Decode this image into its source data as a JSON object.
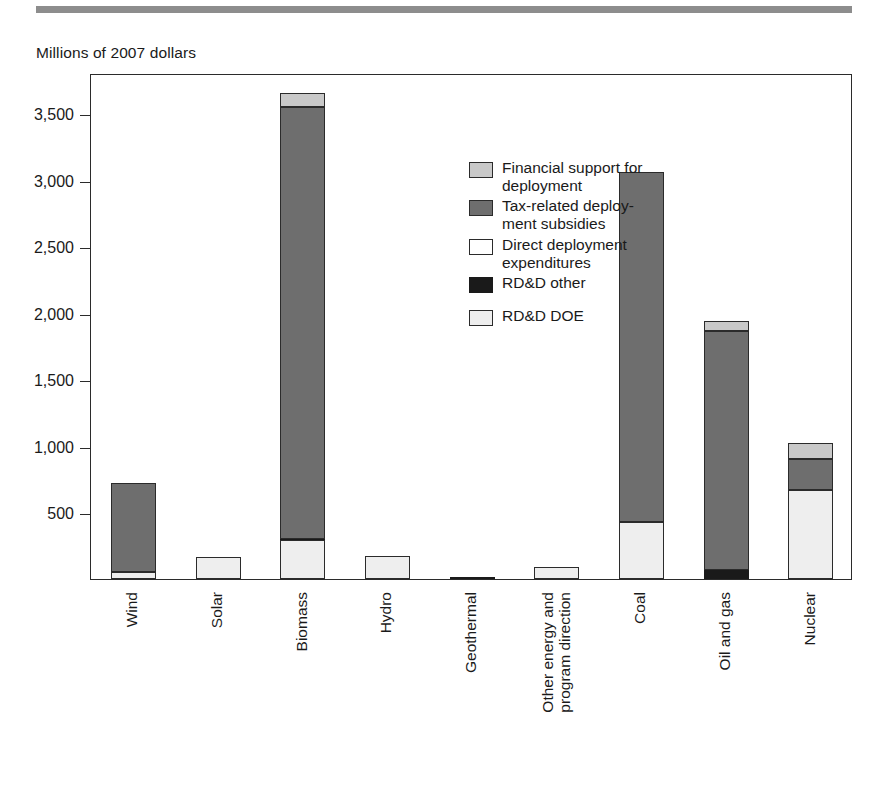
{
  "figure": {
    "axis_title": "Millions of 2007 dollars",
    "rule_color": "#8d8d8d"
  },
  "legend": {
    "position": "inside-top-center",
    "entries": [
      {
        "key": "financial",
        "label": "Financial support for\ndeployment",
        "color": "#c9c9c9",
        "swatch": "light-gray-square-icon"
      },
      {
        "key": "tax",
        "label": "Tax-related deploy-\nment subsidies",
        "color": "#6e6e6e",
        "swatch": "dark-gray-square-icon"
      },
      {
        "key": "direct",
        "label": "Direct deployment\nexpenditures",
        "color": "#ffffff",
        "swatch": "white-square-icon"
      },
      {
        "key": "rdd_other",
        "label": "RD&D other",
        "color": "#1a1a1a",
        "swatch": "black-square-icon"
      },
      {
        "key": "rdd_doe",
        "label": "RD&D DOE",
        "color": "#eeeeee",
        "swatch": "very-light-gray-square-icon"
      }
    ]
  },
  "chart_data": {
    "type": "bar",
    "stacked": true,
    "title": "",
    "subtitle": "",
    "xlabel": "",
    "ylabel": "Millions of 2007 dollars",
    "ylim": [
      0,
      3800
    ],
    "yticks": [
      500,
      1000,
      1500,
      2000,
      2500,
      3000,
      3500
    ],
    "ytick_labels": [
      "500",
      "1,000",
      "1,500",
      "2,000",
      "2,500",
      "3,000",
      "3,500"
    ],
    "grid": false,
    "legend_position": "inside-top-center",
    "categories": [
      "Wind",
      "Solar",
      "Biomass",
      "Hydro",
      "Geothermal",
      "Other energy and\nprogram direction",
      "Coal",
      "Oil and gas",
      "Nuclear"
    ],
    "series": [
      {
        "name": "RD&D DOE",
        "key": "rdd_doe",
        "color": "#eeeeee",
        "values": [
          50,
          165,
          290,
          175,
          0,
          90,
          430,
          0,
          670
        ]
      },
      {
        "name": "RD&D other",
        "key": "rdd_other",
        "color": "#1a1a1a",
        "values": [
          0,
          0,
          12,
          0,
          15,
          0,
          0,
          65,
          0
        ]
      },
      {
        "name": "Direct deployment expenditures",
        "key": "direct",
        "color": "#ffffff",
        "values": [
          0,
          0,
          0,
          0,
          0,
          0,
          0,
          0,
          0
        ]
      },
      {
        "name": "Tax-related deployment subsidies",
        "key": "tax",
        "color": "#6e6e6e",
        "values": [
          670,
          0,
          3240,
          0,
          0,
          0,
          2630,
          1800,
          230
        ]
      },
      {
        "name": "Financial support for deployment",
        "key": "financial",
        "color": "#c9c9c9",
        "values": [
          0,
          0,
          110,
          0,
          0,
          0,
          0,
          70,
          125
        ]
      }
    ],
    "totals": [
      720,
      165,
      3652,
      175,
      15,
      90,
      3060,
      1935,
      1025
    ]
  }
}
